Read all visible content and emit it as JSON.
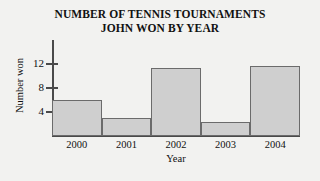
{
  "chart_data": {
    "type": "bar",
    "title": "NUMBER OF TENNIS TOURNAMENTS JOHN WON BY YEAR",
    "title_lines": [
      "NUMBER OF TENNIS TOURNAMENTS",
      "JOHN WON BY YEAR"
    ],
    "categories": [
      "2000",
      "2001",
      "2002",
      "2003",
      "2004"
    ],
    "values": [
      6,
      3,
      11.3,
      2.3,
      11.7
    ],
    "xlabel": "Year",
    "ylabel": "Number won",
    "ylim": [
      0,
      16
    ],
    "yticks": [
      4,
      8,
      12
    ],
    "ytick_labels": [
      "4",
      "8",
      "12"
    ],
    "grid": false,
    "legend": false,
    "bar_fill_color": "#cfcfcf",
    "bar_border_color": "#6b6b6b",
    "axis_color": "#4a4a4a",
    "background_color": "#f2f2f0"
  }
}
